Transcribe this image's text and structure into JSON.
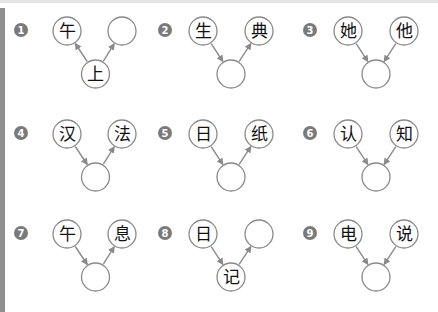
{
  "colors": {
    "badge": "#7a7a7a",
    "circle_stroke": "#8a8a8a",
    "arrow": "#8a8a8a",
    "char": "#111111"
  },
  "panels": [
    {
      "number": "1",
      "layout": "bottom-source",
      "left": "午",
      "right": "",
      "bottom": "上"
    },
    {
      "number": "2",
      "layout": "chain",
      "left": "生",
      "right": "典",
      "bottom": ""
    },
    {
      "number": "3",
      "layout": "converge",
      "left": "她",
      "right": "他",
      "bottom": ""
    },
    {
      "number": "4",
      "layout": "chain",
      "left": "汉",
      "right": "法",
      "bottom": ""
    },
    {
      "number": "5",
      "layout": "chain",
      "left": "日",
      "right": "纸",
      "bottom": ""
    },
    {
      "number": "6",
      "layout": "converge",
      "left": "认",
      "right": "知",
      "bottom": ""
    },
    {
      "number": "7",
      "layout": "chain",
      "left": "午",
      "right": "息",
      "bottom": ""
    },
    {
      "number": "8",
      "layout": "chain",
      "left": "日",
      "right": "",
      "bottom": "记"
    },
    {
      "number": "9",
      "layout": "converge",
      "left": "电",
      "right": "说",
      "bottom": ""
    }
  ]
}
